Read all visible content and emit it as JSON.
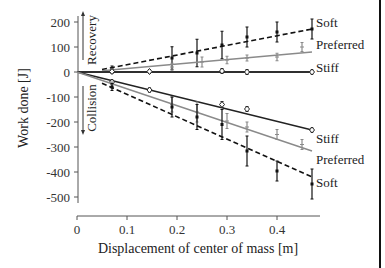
{
  "chart_data": {
    "type": "line",
    "title": "",
    "xlabel": "Displacement of center of mass [m]",
    "ylabel": "Work done [J]",
    "xlim": [
      0,
      0.48
    ],
    "ylim": [
      -520,
      230
    ],
    "xticks": [
      0,
      0.1,
      0.2,
      0.3,
      0.4
    ],
    "xtick_labels": [
      "0",
      "0.1",
      "0.2",
      "0.3",
      "0.4"
    ],
    "yticks": [
      200,
      100,
      0,
      -100,
      -200,
      -300,
      -400,
      -500
    ],
    "ytick_labels": [
      "200",
      "100",
      "0",
      "-100",
      "-200",
      "-300",
      "-400",
      "-500"
    ],
    "grid": false,
    "legend": "inline labels at right end of lines",
    "annotations": [
      {
        "text": "Recovery",
        "direction": "up",
        "region": "positive work"
      },
      {
        "text": "Collision",
        "direction": "down",
        "region": "negative work"
      }
    ],
    "series": [
      {
        "name": "Soft",
        "phase": "Recovery",
        "style": "dashed",
        "color": "#111111",
        "marker": "square",
        "fit_line": [
          [
            0.05,
            10
          ],
          [
            0.47,
            172
          ]
        ],
        "x": [
          0.07,
          0.19,
          0.24,
          0.29,
          0.34,
          0.4,
          0.47
        ],
        "y": [
          10,
          56,
          76,
          108,
          140,
          160,
          172
        ],
        "err": [
          14,
          45,
          55,
          55,
          40,
          40,
          40
        ]
      },
      {
        "name": "Preferred",
        "phase": "Recovery",
        "style": "solid",
        "color": "#8a8a8a",
        "marker": "plus",
        "fit_line": [
          [
            0.05,
            5
          ],
          [
            0.47,
            80
          ]
        ],
        "x": [
          0.07,
          0.19,
          0.25,
          0.3,
          0.34,
          0.4,
          0.45
        ],
        "y": [
          5,
          20,
          40,
          48,
          56,
          60,
          100
        ],
        "err": [
          8,
          15,
          20,
          15,
          12,
          15,
          18
        ]
      },
      {
        "name": "Stiff",
        "phase": "Recovery",
        "style": "solid",
        "color": "#222222",
        "marker": "diamond",
        "fit_line": [
          [
            0.0,
            0
          ],
          [
            0.47,
            0
          ]
        ],
        "x": [
          0.07,
          0.145,
          0.29,
          0.34,
          0.47
        ],
        "y": [
          2,
          2,
          4,
          0,
          0
        ],
        "err": [
          6,
          8,
          10,
          10,
          8
        ]
      },
      {
        "name": "Stiff",
        "phase": "Collision",
        "style": "solid",
        "color": "#222222",
        "marker": "diamond",
        "fit_line": [
          [
            0.0,
            0
          ],
          [
            0.47,
            -232
          ]
        ],
        "x": [
          0.07,
          0.145,
          0.29,
          0.34,
          0.47
        ],
        "y": [
          -40,
          -72,
          -130,
          -148,
          -232
        ],
        "err": [
          8,
          8,
          12,
          10,
          8
        ]
      },
      {
        "name": "Preferred",
        "phase": "Collision",
        "style": "solid",
        "color": "#8a8a8a",
        "marker": "plus",
        "fit_line": [
          [
            0.0,
            0
          ],
          [
            0.47,
            -316
          ]
        ],
        "x": [
          0.07,
          0.19,
          0.24,
          0.3,
          0.34,
          0.4,
          0.45
        ],
        "y": [
          -50,
          -130,
          -160,
          -196,
          -220,
          -250,
          -290
        ],
        "err": [
          10,
          30,
          40,
          30,
          20,
          20,
          20
        ]
      },
      {
        "name": "Soft",
        "phase": "Collision",
        "style": "dashed",
        "color": "#111111",
        "marker": "square",
        "fit_line": [
          [
            0.05,
            -45
          ],
          [
            0.47,
            -420
          ]
        ],
        "x": [
          0.07,
          0.19,
          0.24,
          0.29,
          0.34,
          0.4,
          0.47
        ],
        "y": [
          -60,
          -140,
          -180,
          -210,
          -316,
          -396,
          -448
        ],
        "err": [
          14,
          40,
          50,
          60,
          60,
          40,
          60
        ]
      }
    ]
  },
  "labels": {
    "soft_top": "Soft",
    "preferred_top": "Preferred",
    "stiff_top": "Stiff",
    "stiff_bottom": "Stiff",
    "preferred_bottom": "Preferred",
    "soft_bottom": "Soft",
    "recovery": "Recovery",
    "collision": "Collision",
    "xlabel": "Displacement of center of mass [m]",
    "ylabel": "Work done [J]"
  }
}
